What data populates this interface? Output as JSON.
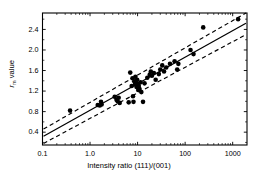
{
  "chart_data": {
    "type": "scatter",
    "title": "",
    "xlabel": "Intensity ratio (111)/(001)",
    "ylabel": "r_m value",
    "ylabel_base": "r",
    "ylabel_sub": "m",
    "ylabel_rest": " value",
    "xscale": "log",
    "yscale": "linear",
    "xlim": [
      0.1,
      2000
    ],
    "ylim": [
      0.15,
      2.72
    ],
    "xticks": [
      0.1,
      1.0,
      10,
      100,
      1000
    ],
    "xticklabels": [
      "0.1",
      "1.0",
      "10",
      "100",
      "1000"
    ],
    "yticks": [
      0.4,
      0.8,
      1.2,
      1.6,
      2.0,
      2.4
    ],
    "yticklabels": [
      "0.4",
      "0.8",
      "1.2",
      "1.6",
      "2.0",
      "2.4"
    ],
    "grid": false,
    "legend": null,
    "marker": "filled-circle",
    "marker_color": "#000000",
    "marker_size_px": 4.6,
    "points": [
      {
        "x": 0.38,
        "y": 0.82
      },
      {
        "x": 1.45,
        "y": 0.93
      },
      {
        "x": 1.6,
        "y": 0.92
      },
      {
        "x": 1.7,
        "y": 0.99
      },
      {
        "x": 1.75,
        "y": 0.94
      },
      {
        "x": 3.3,
        "y": 1.09
      },
      {
        "x": 3.6,
        "y": 1.03
      },
      {
        "x": 3.8,
        "y": 1.0
      },
      {
        "x": 4.0,
        "y": 1.07
      },
      {
        "x": 4.2,
        "y": 0.97
      },
      {
        "x": 6.5,
        "y": 0.98
      },
      {
        "x": 7.0,
        "y": 1.56
      },
      {
        "x": 7.5,
        "y": 1.3
      },
      {
        "x": 7.8,
        "y": 1.45
      },
      {
        "x": 8.0,
        "y": 1.1
      },
      {
        "x": 8.2,
        "y": 0.99
      },
      {
        "x": 8.5,
        "y": 1.39
      },
      {
        "x": 8.8,
        "y": 1.33
      },
      {
        "x": 9.0,
        "y": 1.48
      },
      {
        "x": 9.2,
        "y": 1.36
      },
      {
        "x": 9.5,
        "y": 1.28
      },
      {
        "x": 9.8,
        "y": 1.42
      },
      {
        "x": 10.0,
        "y": 1.34
      },
      {
        "x": 10.3,
        "y": 1.22
      },
      {
        "x": 10.6,
        "y": 1.3
      },
      {
        "x": 11.0,
        "y": 1.24
      },
      {
        "x": 11.5,
        "y": 1.37
      },
      {
        "x": 12.0,
        "y": 1.18
      },
      {
        "x": 13.0,
        "y": 0.99
      },
      {
        "x": 14.0,
        "y": 1.35
      },
      {
        "x": 16.0,
        "y": 1.46
      },
      {
        "x": 18.0,
        "y": 1.52
      },
      {
        "x": 19.0,
        "y": 1.58
      },
      {
        "x": 20.0,
        "y": 1.5
      },
      {
        "x": 22.0,
        "y": 1.55
      },
      {
        "x": 24.0,
        "y": 1.42
      },
      {
        "x": 28.0,
        "y": 1.53
      },
      {
        "x": 30.0,
        "y": 1.62
      },
      {
        "x": 33.0,
        "y": 1.7
      },
      {
        "x": 36.0,
        "y": 1.58
      },
      {
        "x": 40.0,
        "y": 1.66
      },
      {
        "x": 48.0,
        "y": 1.73
      },
      {
        "x": 60.0,
        "y": 1.78
      },
      {
        "x": 68.0,
        "y": 1.62
      },
      {
        "x": 72.0,
        "y": 1.73
      },
      {
        "x": 130.0,
        "y": 2.0
      },
      {
        "x": 150.0,
        "y": 1.92
      },
      {
        "x": 240.0,
        "y": 2.44
      },
      {
        "x": 1300.0,
        "y": 2.6
      }
    ],
    "fit_line": {
      "style": "solid",
      "color": "#000000",
      "x": [
        0.105,
        1900
      ],
      "y": [
        0.32,
        2.52
      ]
    },
    "confidence_bands": [
      {
        "name": "upper-band",
        "style": "dashed",
        "color": "#000000",
        "x": [
          0.105,
          1900
        ],
        "y": [
          0.46,
          2.72
        ]
      },
      {
        "name": "lower-band",
        "style": "dashed",
        "color": "#000000",
        "x": [
          0.105,
          1900
        ],
        "y": [
          0.18,
          2.3
        ]
      }
    ]
  }
}
